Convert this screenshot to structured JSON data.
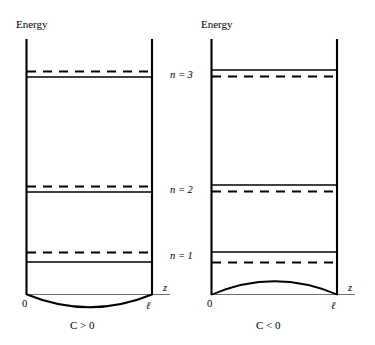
{
  "figure": {
    "axis_label_energy": "Energy",
    "axis_label_z": "z",
    "origin_label": "0",
    "width_label": "ℓ"
  },
  "level_labels": [
    {
      "id": "n3",
      "text": "n = 3"
    },
    {
      "id": "n2",
      "text": "n = 2"
    },
    {
      "id": "n1",
      "text": "n = 1"
    }
  ],
  "panels": [
    {
      "id": "left",
      "caption": "C > 0",
      "energy_label": "Energy",
      "axis_label_z": "z",
      "origin_label": "0",
      "width_label": "ℓ",
      "curve_direction": "downward",
      "levels": [
        {
          "name": "n = 3",
          "solid_y": 77,
          "dashed_y": 71,
          "dashed_above": true
        },
        {
          "name": "n = 2",
          "solid_y": 192,
          "dashed_y": 186,
          "dashed_above": true
        },
        {
          "name": "n = 1",
          "solid_y": 262,
          "dashed_y": 252,
          "dashed_above": true
        }
      ]
    },
    {
      "id": "right",
      "caption": "C < 0",
      "energy_label": "Energy",
      "axis_label_z": "z",
      "origin_label": "0",
      "width_label": "ℓ",
      "curve_direction": "upward",
      "levels": [
        {
          "name": "n = 3",
          "solid_y": 70,
          "dashed_y": 76,
          "dashed_above": false
        },
        {
          "name": "n = 2",
          "solid_y": 185,
          "dashed_y": 191,
          "dashed_above": false
        },
        {
          "name": "n = 1",
          "solid_y": 252,
          "dashed_y": 262,
          "dashed_above": false
        }
      ]
    }
  ],
  "colors": {
    "ink": "#000000",
    "baseline": "#6d6d6d",
    "background": "#ffffff"
  }
}
